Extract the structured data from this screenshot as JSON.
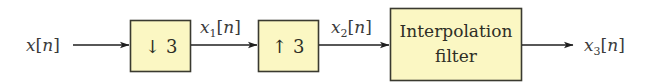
{
  "diagram": {
    "colors": {
      "box_fill": "#fbf7c3",
      "box_stroke": "#3a3a30",
      "wire": "#1f1f1f",
      "text": "#3b3b3b"
    },
    "signals": {
      "input": {
        "var": "x",
        "sub": "",
        "arg": "n"
      },
      "s1": {
        "var": "x",
        "sub": "1",
        "arg": "n"
      },
      "s2": {
        "var": "x",
        "sub": "2",
        "arg": "n"
      },
      "output": {
        "var": "x",
        "sub": "3",
        "arg": "n"
      }
    },
    "blocks": [
      {
        "id": "downsampler",
        "symbol": "↓",
        "factor": "3"
      },
      {
        "id": "upsampler",
        "symbol": "↑",
        "factor": "3"
      },
      {
        "id": "interpolation-filter",
        "line1": "Interpolation",
        "line2": "filter"
      }
    ]
  }
}
